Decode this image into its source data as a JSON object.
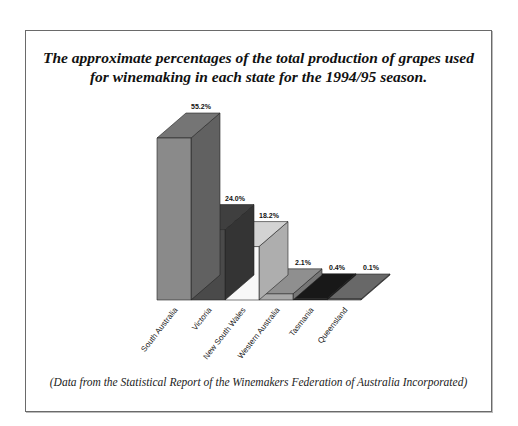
{
  "chart_data": {
    "type": "bar",
    "style": "3d",
    "title": "The approximate percentages of the total production of grapes used for winemaking in each state for the 1994/95 season.",
    "title_lines": [
      "The approximate percentages of the total production of grapes used",
      "for winemaking in each state for the 1994/95 season."
    ],
    "categories": [
      "South Australia",
      "Victoria",
      "New South Wales",
      "Western Australia",
      "Tasmania",
      "Queensland"
    ],
    "values": [
      55.2,
      24.0,
      18.2,
      2.1,
      0.4,
      0.1
    ],
    "value_labels": [
      "55.2%",
      "24.0%",
      "18.2%",
      "2.1%",
      "0.4%",
      "0.1%"
    ],
    "colors": [
      "#8a8a8a",
      "#4a4a4a",
      "#f8f8f8",
      "#a8a8a8",
      "#1c1c1c",
      "#7a7a7a"
    ],
    "xlabel": "",
    "ylabel": "",
    "ylim": [
      0,
      60
    ],
    "grid": false,
    "legend": "none",
    "footnote": "(Data from the Statistical Report of the Winemakers Federation of Australia Incorporated)"
  }
}
